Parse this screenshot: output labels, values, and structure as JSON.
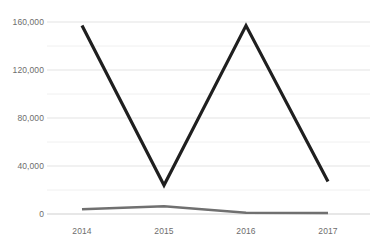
{
  "chart_data": {
    "type": "line",
    "title": "",
    "subtitle": "",
    "xlabel": "",
    "ylabel": "",
    "categories": [
      "2014",
      "2015",
      "2016",
      "2017"
    ],
    "x": [
      2014,
      2015,
      2016,
      2017
    ],
    "series": [
      {
        "name": "series-1",
        "color": "#1f1f1f",
        "width": 3.2,
        "values": [
          157000,
          24000,
          157000,
          27000
        ]
      },
      {
        "name": "series-2",
        "color": "#707070",
        "width": 2.6,
        "values": [
          4000,
          6500,
          1000,
          800
        ]
      }
    ],
    "ylim": [
      0,
      160000
    ],
    "xlim": [
      2014,
      2017
    ],
    "yticks": [
      0,
      40000,
      80000,
      120000,
      160000
    ],
    "ytick_labels": [
      "0",
      "40,000",
      "80,000",
      "120,000",
      "160,000"
    ],
    "minor_yticks": [
      20000,
      60000,
      100000,
      140000
    ],
    "xtick_labels": [
      "2014",
      "2015",
      "2016",
      "2017"
    ],
    "grid": {
      "horizontal": true,
      "vertical": false,
      "major_color": "#e3e3e3",
      "minor_color": "#f0f0f0",
      "baseline_color": "#cfcfcf"
    },
    "legend": {
      "visible": false,
      "position": "none",
      "entries": []
    },
    "background": "#ffffff",
    "tick_text_color": "#6d6d6d"
  },
  "axes": {
    "y_labels": [
      "160,000",
      "120,000",
      "80,000",
      "40,000",
      "0"
    ],
    "x_labels": [
      "2014",
      "2015",
      "2016",
      "2017"
    ]
  }
}
